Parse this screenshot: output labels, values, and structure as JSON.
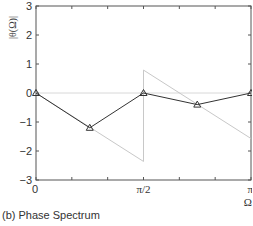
{
  "caption": "(b) Phase Spectrum",
  "chart_data": {
    "type": "line",
    "title": "",
    "caption": "(b) Phase Spectrum",
    "xlabel": "Ω",
    "ylabel": "|θ(Ω)|",
    "xlim": [
      0,
      3.14159
    ],
    "ylim": [
      -3,
      3
    ],
    "x_ticks": [
      {
        "value": 0,
        "label": "0"
      },
      {
        "value": 1.5708,
        "label": "π/2"
      },
      {
        "value": 3.14159,
        "label": "π"
      }
    ],
    "y_ticks": [
      {
        "value": 3,
        "label": "3"
      },
      {
        "value": 2,
        "label": "2"
      },
      {
        "value": 1,
        "label": "1"
      },
      {
        "value": 0,
        "label": "0"
      },
      {
        "value": -1,
        "label": "−1"
      },
      {
        "value": -2,
        "label": "−2"
      },
      {
        "value": -3,
        "label": "−3"
      }
    ],
    "grid": false,
    "legend": null,
    "series": [
      {
        "name": "sampled phase",
        "style": "black line with triangle markers",
        "color": "#333333",
        "x": [
          0,
          0.7854,
          1.5708,
          2.3562,
          3.14159
        ],
        "values": [
          0,
          -1.2,
          0,
          -0.4,
          0
        ]
      },
      {
        "name": "continuous phase",
        "style": "light grey line (wrapped)",
        "color": "#c8c8c8",
        "segments": [
          {
            "x": [
              0,
              1.5708
            ],
            "values": [
              0,
              -2.36
            ]
          },
          {
            "x": [
              1.5708,
              3.14159
            ],
            "values": [
              0.79,
              -1.57
            ]
          }
        ]
      },
      {
        "name": "zero reference",
        "style": "light grey horizontal line",
        "color": "#d8d8d8",
        "x": [
          0,
          3.14159
        ],
        "values": [
          0,
          0
        ]
      }
    ]
  }
}
